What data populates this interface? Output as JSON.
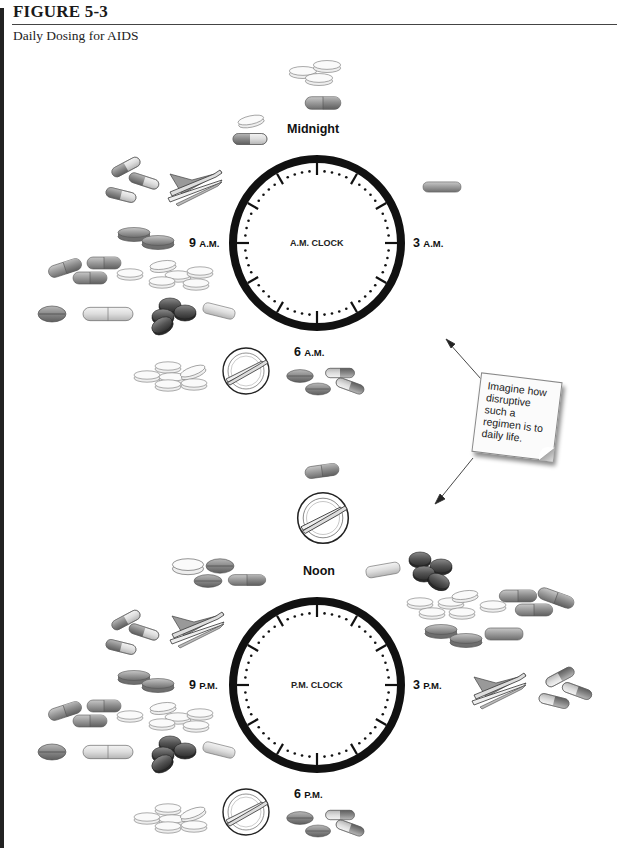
{
  "figure": {
    "number": "FIGURE 5-3",
    "title": "Daily Dosing for AIDS"
  },
  "clocks": [
    {
      "id": "am",
      "center_label": "A.M. CLOCK",
      "hour_labels": {
        "top": {
          "text": "Midnight"
        },
        "right": {
          "num": "3",
          "suffix": "A.M."
        },
        "bottom": {
          "num": "6",
          "suffix": "A.M."
        },
        "left": {
          "num": "9",
          "suffix": "A.M."
        }
      }
    },
    {
      "id": "pm",
      "center_label": "P.M. CLOCK",
      "hour_labels": {
        "top": {
          "text": "Noon"
        },
        "right": {
          "num": "3",
          "suffix": "P.M."
        },
        "bottom": {
          "num": "6",
          "suffix": "P.M."
        },
        "left": {
          "num": "9",
          "suffix": "P.M."
        }
      }
    }
  ],
  "callout": {
    "text": "Imagine how disruptive such a regimen is to daily life."
  },
  "dose_groups": [
    {
      "time": "Midnight",
      "items": [
        "tablet-stack",
        "capsule"
      ]
    },
    {
      "time": "Before midnight",
      "items": [
        "tablet",
        "capsule"
      ]
    },
    {
      "time": "Late evening (A.M. clock, ~10)",
      "items": [
        "capsule",
        "capsule",
        "capsule",
        "napkin-fork-knife"
      ]
    },
    {
      "time": "3 A.M.",
      "items": [
        "oblong-tablet"
      ]
    },
    {
      "time": "9 A.M.",
      "items": [
        "tablets",
        "capsules",
        "white-tablet-pile",
        "tablet",
        "capsule",
        "dark-tablet-cluster",
        "oblong-tablet"
      ]
    },
    {
      "time": "6 A.M.",
      "items": [
        "white-tablet-pile",
        "plate-fork-knife",
        "tablets",
        "capsules"
      ]
    },
    {
      "time": "Noon",
      "items": [
        "capsule",
        "plate-fork-knife"
      ]
    },
    {
      "time": "After noon",
      "items": [
        "oblong-tablet",
        "dark-tablet-cluster",
        "white-tablet-pile",
        "capsules",
        "tablets",
        "oblong-tablet"
      ]
    },
    {
      "time": "Before noon",
      "items": [
        "tablets",
        "capsule"
      ]
    },
    {
      "time": "Late evening (P.M. clock, ~10)",
      "items": [
        "capsule",
        "capsule",
        "capsule",
        "napkin-fork-knife"
      ]
    },
    {
      "time": "3 P.M.",
      "items": [
        "napkin-fork-knife",
        "capsule",
        "capsule",
        "capsule"
      ]
    },
    {
      "time": "9 P.M.",
      "items": [
        "tablets",
        "capsules",
        "white-tablet-pile",
        "tablet",
        "capsule",
        "dark-tablet-cluster",
        "oblong-tablet"
      ]
    },
    {
      "time": "6 P.M.",
      "items": [
        "white-tablet-pile",
        "plate-fork-knife",
        "tablets",
        "capsules"
      ]
    }
  ],
  "colors": {
    "clock_ring": "#111111",
    "pill_gray": "#9a9a9a",
    "pill_dark": "#4a4a4a",
    "pill_light": "#dcdcdc",
    "background": "#ffffff"
  }
}
